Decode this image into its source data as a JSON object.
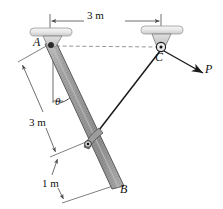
{
  "figure": {
    "background_color": "#ffffff",
    "line_color": "#1a1a1a",
    "rod_fill": "#9a9a9a",
    "rod_edge": "#555555",
    "support_fill": "#e2e2e2",
    "bracket_fill": "#d4d4d4",
    "dimension_color": "#4a4a4a",
    "dashed_color": "#7a7a7a"
  },
  "labels": {
    "point_a": "A",
    "point_b": "B",
    "point_c": "C",
    "force_p": "P",
    "angle_theta": "θ"
  },
  "dimensions": {
    "top_span": "3 m",
    "left_span": "3 m",
    "bottom_span": "1 m"
  },
  "geometry": {
    "a": [
      50,
      44
    ],
    "b": [
      116,
      186
    ],
    "c": [
      161,
      50
    ],
    "collar": [
      88,
      143
    ],
    "p_tip": [
      202,
      72
    ]
  }
}
